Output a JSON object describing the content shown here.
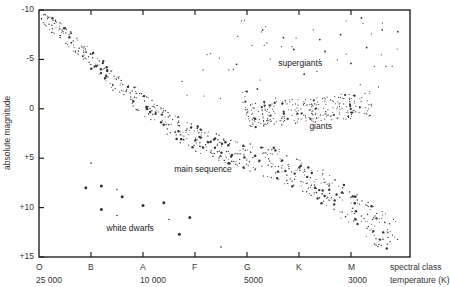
{
  "chart_data": {
    "type": "scatter",
    "title": "",
    "xlabel": "spectral class temperature (K)",
    "ylabel": "absolute magnitude",
    "ylim": [
      -10,
      15
    ],
    "y_inverted": true,
    "yticks": [
      "-10",
      "-5",
      "0",
      "+5",
      "+10",
      "+15"
    ],
    "xticks": [
      {
        "class": "O",
        "temp": "25 000"
      },
      {
        "class": "B",
        "temp": ""
      },
      {
        "class": "A",
        "temp": "10 000"
      },
      {
        "class": "F",
        "temp": ""
      },
      {
        "class": "G",
        "temp": "5000"
      },
      {
        "class": "K",
        "temp": ""
      },
      {
        "class": "M",
        "temp": "3000"
      }
    ],
    "x_axis_title_line1": "spectral class",
    "x_axis_title_line2": "temperature (K)",
    "grid": false,
    "annotations": [
      {
        "text": "supergiants",
        "x_class_pos": 4.6,
        "mag": -4.5
      },
      {
        "text": "giants",
        "x_class_pos": 5.2,
        "mag": 1.8
      },
      {
        "text": "main sequence",
        "x_class_pos": 2.6,
        "mag": 6.2
      },
      {
        "text": "white dwarfs",
        "x_class_pos": 1.3,
        "mag": 12.2
      }
    ],
    "series": [
      {
        "name": "main sequence",
        "trend": [
          [
            0.0,
            -9.5
          ],
          [
            0.5,
            -7.5
          ],
          [
            1.0,
            -5.0
          ],
          [
            1.5,
            -2.5
          ],
          [
            2.0,
            -0.5
          ],
          [
            2.5,
            1.5
          ],
          [
            3.0,
            3.0
          ],
          [
            3.5,
            4.0
          ],
          [
            4.0,
            4.8
          ],
          [
            4.5,
            5.5
          ],
          [
            5.0,
            6.5
          ],
          [
            5.5,
            8.0
          ],
          [
            6.0,
            10.0
          ],
          [
            6.5,
            12.0
          ],
          [
            6.9,
            13.5
          ]
        ]
      },
      {
        "name": "giants",
        "trend": [
          [
            4.0,
            0.8
          ],
          [
            4.5,
            0.5
          ],
          [
            5.0,
            0.2
          ],
          [
            5.5,
            0.0
          ],
          [
            6.0,
            -0.3
          ],
          [
            6.4,
            -0.5
          ]
        ]
      },
      {
        "name": "supergiants",
        "points": [
          [
            4.3,
            -8.0
          ],
          [
            4.7,
            -7.2
          ],
          [
            5.4,
            -7.0
          ],
          [
            6.2,
            -9.2
          ],
          [
            6.6,
            -8.0
          ],
          [
            6.9,
            -7.8
          ],
          [
            3.8,
            -4.5
          ],
          [
            4.2,
            -2.0
          ],
          [
            5.1,
            -3.5
          ],
          [
            5.5,
            -5.8
          ],
          [
            6.0,
            -4.6
          ],
          [
            6.3,
            -6.2
          ],
          [
            4.9,
            -6.0
          ],
          [
            5.8,
            -7.5
          ]
        ]
      },
      {
        "name": "white dwarfs",
        "points": [
          [
            1.0,
            5.5
          ],
          [
            0.9,
            8.0
          ],
          [
            1.2,
            7.8
          ],
          [
            1.5,
            8.2
          ],
          [
            1.6,
            8.9
          ],
          [
            1.2,
            10.2
          ],
          [
            1.5,
            10.8
          ],
          [
            2.0,
            9.8
          ],
          [
            2.4,
            9.5
          ],
          [
            2.5,
            11.2
          ],
          [
            2.9,
            11.0
          ],
          [
            2.7,
            12.7
          ],
          [
            3.5,
            14.0
          ]
        ]
      }
    ]
  },
  "colors": {
    "axis": "#222222",
    "dot": "#333333",
    "background": "#ffffff"
  }
}
